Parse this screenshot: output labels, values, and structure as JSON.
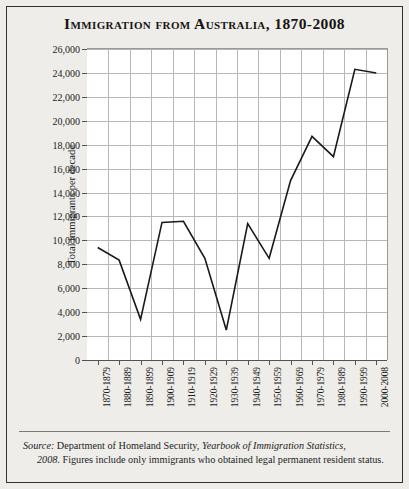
{
  "title": "Immigration from Australia, 1870-2008",
  "source": {
    "label": "Source:",
    "line1_a": " Department of Homeland Security, ",
    "line1_b": "Yearbook of Immigration Statistics,",
    "line2_a": "2008.",
    "line2_b": " Figures include only immigrants who obtained legal permanent",
    "line3": "resident status."
  },
  "chart_data": {
    "type": "line",
    "title": "Immigration from Australia, 1870-2008",
    "xlabel": "",
    "ylabel": "Total immigrants per decade",
    "categories": [
      "1870-1879",
      "1880-1889",
      "1890-1899",
      "1900-1909",
      "1910-1919",
      "1920-1929",
      "1930-1939",
      "1940-1949",
      "1950-1959",
      "1960-1969",
      "1970-1979",
      "1980-1989",
      "1990-1999",
      "2000-2008"
    ],
    "values": [
      9400,
      8350,
      3400,
      11500,
      11600,
      8500,
      2500,
      11400,
      8500,
      15000,
      18700,
      17000,
      24300,
      24000
    ],
    "ylim": [
      0,
      26000
    ],
    "ytick_step": 2000,
    "ytick_labels": [
      "0",
      "2,000",
      "4,000",
      "6,000",
      "8,000",
      "10,000",
      "12,000",
      "14,000",
      "16,000",
      "18,000",
      "20,000",
      "22,000",
      "24,000",
      "26,000"
    ],
    "grid": true,
    "legend": "none",
    "line_color": "#1b1917",
    "plot_background": "#ffffff",
    "grid_color": "#b9b7b3"
  }
}
